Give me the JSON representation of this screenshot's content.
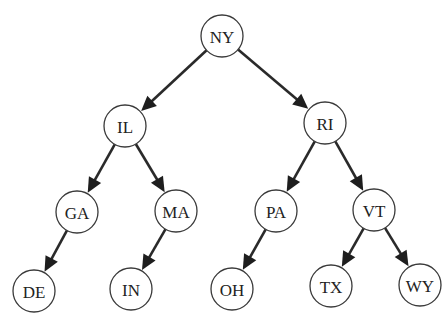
{
  "diagram": {
    "type": "binary-tree",
    "title": "",
    "node_radius": 21,
    "colors": {
      "background": "#ffffff",
      "node_fill": "#ffffff",
      "node_stroke": "#3a3a3a",
      "edge": "#2a2a2a",
      "label": "#222222"
    },
    "nodes": [
      {
        "id": "NY",
        "label": "NY",
        "x": 222,
        "y": 36
      },
      {
        "id": "IL",
        "label": "IL",
        "x": 125,
        "y": 126
      },
      {
        "id": "RI",
        "label": "RI",
        "x": 325,
        "y": 123
      },
      {
        "id": "GA",
        "label": "GA",
        "x": 77,
        "y": 212
      },
      {
        "id": "MA",
        "label": "MA",
        "x": 176,
        "y": 211
      },
      {
        "id": "PA",
        "label": "PA",
        "x": 276,
        "y": 211
      },
      {
        "id": "VT",
        "label": "VT",
        "x": 374,
        "y": 210
      },
      {
        "id": "DE",
        "label": "DE",
        "x": 34,
        "y": 291
      },
      {
        "id": "IN",
        "label": "IN",
        "x": 131,
        "y": 289
      },
      {
        "id": "OH",
        "label": "OH",
        "x": 232,
        "y": 289
      },
      {
        "id": "TX",
        "label": "TX",
        "x": 331,
        "y": 286
      },
      {
        "id": "WY",
        "label": "WY",
        "x": 420,
        "y": 285
      }
    ],
    "edges": [
      {
        "from": "NY",
        "to": "IL"
      },
      {
        "from": "NY",
        "to": "RI"
      },
      {
        "from": "IL",
        "to": "GA"
      },
      {
        "from": "IL",
        "to": "MA"
      },
      {
        "from": "RI",
        "to": "PA"
      },
      {
        "from": "RI",
        "to": "VT"
      },
      {
        "from": "GA",
        "to": "DE"
      },
      {
        "from": "MA",
        "to": "IN"
      },
      {
        "from": "PA",
        "to": "OH"
      },
      {
        "from": "VT",
        "to": "TX"
      },
      {
        "from": "VT",
        "to": "WY"
      }
    ]
  }
}
